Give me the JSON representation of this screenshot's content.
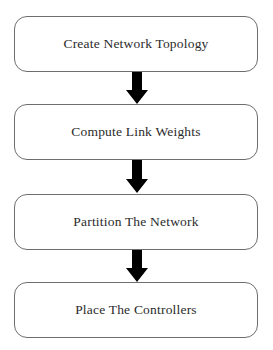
{
  "diagram": {
    "orientation": "vertical",
    "background_color": "#ffffff",
    "box_border_color": "#6e6e6e",
    "box_fill_color": "#ffffff",
    "text_color": "#2b2b2b",
    "arrow_color": "#000000",
    "nodes": [
      {
        "id": "step-1",
        "label": "Create Network Topology"
      },
      {
        "id": "step-2",
        "label": "Compute Link Weights"
      },
      {
        "id": "step-3",
        "label": "Partition The Network"
      },
      {
        "id": "step-4",
        "label": "Place The Controllers"
      }
    ],
    "connectors": [
      {
        "id": "arrow-1",
        "from": "step-1",
        "to": "step-2",
        "icon": "arrow-down-icon"
      },
      {
        "id": "arrow-2",
        "from": "step-2",
        "to": "step-3",
        "icon": "arrow-down-icon"
      },
      {
        "id": "arrow-3",
        "from": "step-3",
        "to": "step-4",
        "icon": "arrow-down-icon"
      }
    ]
  }
}
